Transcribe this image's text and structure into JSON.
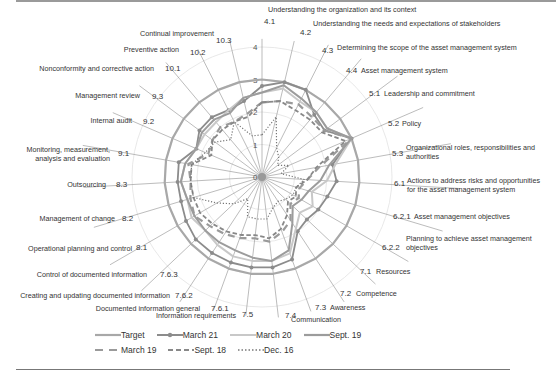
{
  "chart_data": {
    "type": "radar",
    "title": "",
    "radial_ticks": [
      "0",
      "1",
      "2",
      "3",
      "4"
    ],
    "rlim": [
      0,
      4
    ],
    "categories": [
      {
        "code": "4.1",
        "label": "Understanding the organization and its context"
      },
      {
        "code": "4.2",
        "label": "Understanding the needs and expectations of stakeholders"
      },
      {
        "code": "4.3",
        "label": "Determining the scope of the asset management system"
      },
      {
        "code": "4.4",
        "label": "Asset management system"
      },
      {
        "code": "5.1",
        "label": "Leadership and commitment"
      },
      {
        "code": "5.2",
        "label": "Policy"
      },
      {
        "code": "5.3",
        "label": "Organizational roles, responsibilities and authorities"
      },
      {
        "code": "6.1",
        "label": "Actions to address risks and opportunities for the asset management system"
      },
      {
        "code": "6.2.1",
        "label": "Asset management objectives"
      },
      {
        "code": "6.2.2",
        "label": "Planning to achieve asset management objectives"
      },
      {
        "code": "7.1",
        "label": "Resources"
      },
      {
        "code": "7.2",
        "label": "Competence"
      },
      {
        "code": "7.3",
        "label": "Awareness"
      },
      {
        "code": "7.4",
        "label": "Communication"
      },
      {
        "code": "7.5",
        "label": "Information requirements"
      },
      {
        "code": "7.6.1",
        "label": "Documented information general"
      },
      {
        "code": "7.6.2",
        "label": "Creating and updating documented information"
      },
      {
        "code": "7.6.3",
        "label": "Control of documented information"
      },
      {
        "code": "8.1",
        "label": "Operational planning and control"
      },
      {
        "code": "8.2",
        "label": "Management of change"
      },
      {
        "code": "8.3",
        "label": "Outsourcing"
      },
      {
        "code": "9.1",
        "label": "Monitoring, measurement, analysis and evaluation"
      },
      {
        "code": "9.2",
        "label": "Internal audit"
      },
      {
        "code": "9.3",
        "label": "Management review"
      },
      {
        "code": "10.1",
        "label": "Nonconformity and corrective action"
      },
      {
        "code": "10.2",
        "label": "Preventive action"
      },
      {
        "code": "10.3",
        "label": "Continual improvement"
      }
    ],
    "series": [
      {
        "name": "Target",
        "style": "solid",
        "color": "#a8a8a8",
        "values": [
          3,
          3,
          3,
          3,
          3,
          3,
          3,
          3,
          3,
          3,
          3,
          3,
          3,
          3,
          3,
          3,
          3,
          3,
          3,
          3,
          3,
          3,
          3,
          3,
          3,
          3,
          3
        ]
      },
      {
        "name": "March 21",
        "style": "solid-marker",
        "color": "#8c8c8c",
        "values": [
          2.8,
          3,
          3,
          2.5,
          2.4,
          3,
          2.2,
          2.3,
          2.1,
          2,
          1.9,
          2,
          2.7,
          2.8,
          2.8,
          2.8,
          2.8,
          2.8,
          2.7,
          2.6,
          2.6,
          2.6,
          2.2,
          2.4,
          2.4,
          2.3,
          2.4
        ]
      },
      {
        "name": "March 20",
        "style": "solid",
        "color": "#c8c8c8",
        "values": [
          2.6,
          2.8,
          2.6,
          2.6,
          2.5,
          3,
          2.3,
          2,
          1.6,
          1.8,
          1.6,
          1.9,
          2.5,
          2.6,
          2.6,
          2.6,
          2.5,
          2.4,
          2.5,
          2.4,
          2.5,
          2.4,
          2.2,
          2.2,
          2.2,
          2.3,
          2.5
        ]
      },
      {
        "name": "Sept. 19",
        "style": "solid",
        "color": "#9c9c9c",
        "values": [
          2.6,
          2.9,
          2.7,
          2.6,
          2.5,
          3,
          2.1,
          1.8,
          1.5,
          1.4,
          1.3,
          1.7,
          2.4,
          2.6,
          2.5,
          2.4,
          2.4,
          2.4,
          2.4,
          2.4,
          2.5,
          2.4,
          2.2,
          2.3,
          2.3,
          2.2,
          2.5
        ]
      },
      {
        "name": "March 19",
        "style": "longdash",
        "color": "#9a9a9a",
        "values": [
          2.3,
          2.4,
          2.5,
          2.4,
          2.4,
          3,
          1.8,
          1.4,
          1.2,
          1.3,
          1.2,
          1.6,
          1.8,
          2,
          1.9,
          2,
          2.1,
          2.2,
          2.4,
          2.3,
          2.2,
          2.3,
          1.8,
          1.9,
          2,
          1.9,
          2
        ]
      },
      {
        "name": "Sept. 18",
        "style": "dash",
        "color": "#888888",
        "values": [
          2.3,
          2.4,
          2.3,
          2.3,
          2.3,
          2.8,
          1.7,
          1.4,
          1.1,
          1.2,
          1.1,
          1.4,
          1.7,
          1.9,
          1.8,
          1.9,
          2,
          2.1,
          2.2,
          2.2,
          2.2,
          2.2,
          1.7,
          1.9,
          1.9,
          1.9,
          1.9
        ]
      },
      {
        "name": "Dec. 16",
        "style": "dotted",
        "color": "#777777",
        "values": [
          1.3,
          1.9,
          1,
          0.8,
          0.6,
          0.9,
          0.6,
          1.3,
          1.1,
          1.1,
          1,
          0.9,
          1,
          1.3,
          1.3,
          1.3,
          0.8,
          1.2,
          1.6,
          2.2,
          2.2,
          2.2,
          1.9,
          1.8,
          1.5,
          1.9,
          1.3
        ]
      }
    ],
    "legend_position": "bottom",
    "grid": true
  },
  "legend": {
    "row1": [
      "Target",
      "March 21",
      "March 20",
      "Sept. 19"
    ],
    "row2": [
      "March 19",
      "Sept. 18",
      "Dec. 16"
    ]
  }
}
